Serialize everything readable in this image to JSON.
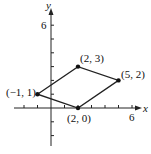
{
  "chart_data": {
    "type": "scatter",
    "title": "",
    "xlabel": "x",
    "ylabel": "y",
    "xlim": [
      -3,
      6.5
    ],
    "ylim": [
      -3,
      7
    ],
    "grid": false,
    "x_tick_labels": [
      "6"
    ],
    "y_tick_labels": [
      "6"
    ],
    "x_ticks": [
      -2,
      -1,
      1,
      2,
      3,
      4,
      5,
      6
    ],
    "y_ticks": [
      -2,
      -1,
      1,
      2,
      3,
      4,
      5,
      6
    ],
    "series": [
      {
        "name": "parallelogram",
        "closed": true,
        "points": [
          {
            "x": -1,
            "y": 1,
            "label": "(−1, 1)"
          },
          {
            "x": 2,
            "y": 3,
            "label": "(2, 3)"
          },
          {
            "x": 5,
            "y": 2,
            "label": "(5, 2)"
          },
          {
            "x": 2,
            "y": 0,
            "label": "(2, 0)"
          }
        ]
      }
    ]
  },
  "labels": {
    "x_axis": "x",
    "y_axis": "y",
    "x_tick_6": "6",
    "y_tick_6": "6",
    "p1": "(−1, 1)",
    "p2": "(2, 3)",
    "p3": "(5, 2)",
    "p4": "(2, 0)"
  }
}
